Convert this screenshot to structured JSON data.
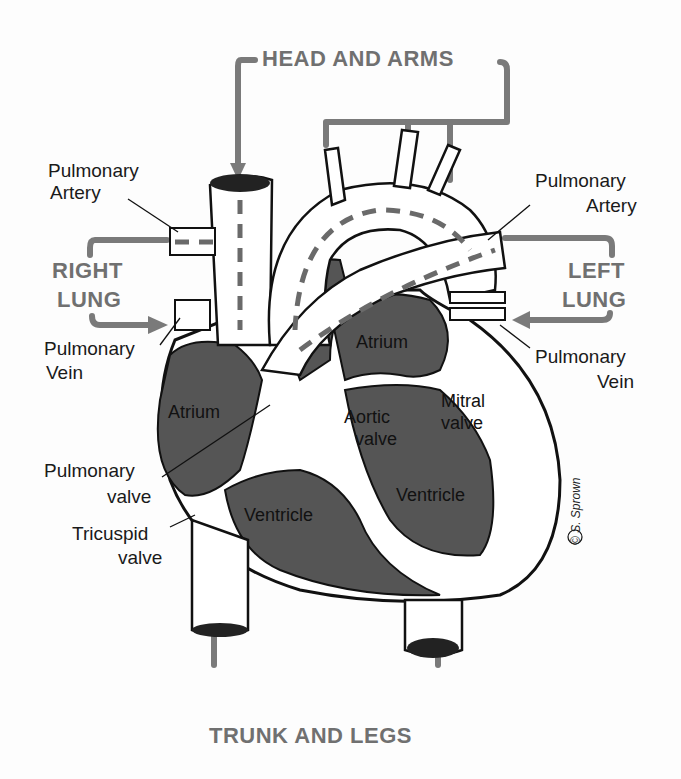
{
  "diagram": {
    "flow_labels": {
      "head_and_arms": "HEAD AND ARMS",
      "right_lung_1": "RIGHT",
      "right_lung_2": "LUNG",
      "left_lung_1": "LEFT",
      "left_lung_2": "LUNG",
      "trunk_and_legs": "TRUNK AND LEGS"
    },
    "outer_labels": {
      "pulmonary_artery_left_1": "Pulmonary",
      "pulmonary_artery_left_2": "Artery",
      "pulmonary_artery_right_1": "Pulmonary",
      "pulmonary_artery_right_2": "Artery",
      "pulmonary_vein_left_1": "Pulmonary",
      "pulmonary_vein_left_2": "Vein",
      "pulmonary_vein_right_1": "Pulmonary",
      "pulmonary_vein_right_2": "Vein",
      "pulmonary_valve_1": "Pulmonary",
      "pulmonary_valve_2": "valve",
      "tricuspid_valve_1": "Tricuspid",
      "tricuspid_valve_2": "valve"
    },
    "inner_labels": {
      "right_atrium": "Atrium",
      "left_atrium": "Atrium",
      "aortic_valve_1": "Aortic",
      "aortic_valve_2": "valve",
      "mitral_valve_1": "Mitral",
      "mitral_valve_2": "valve",
      "right_ventricle": "Ventricle",
      "left_ventricle": "Ventricle"
    },
    "signature": "© S. Sprown",
    "colors": {
      "chamber_fill": "#555555",
      "flow_arrow": "#7a7a7a",
      "outline": "#111111",
      "vessel_fill": "#ffffff"
    }
  }
}
